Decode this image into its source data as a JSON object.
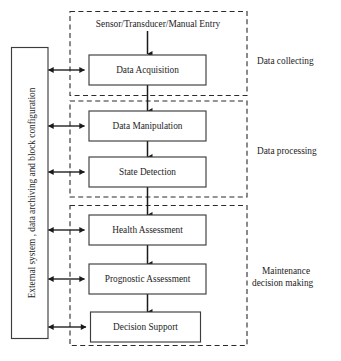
{
  "figure": {
    "type": "block-flow-diagram",
    "canvas": {
      "width": 341,
      "height": 361
    },
    "background_color": "#ffffff",
    "line_color": "#1a1a1a",
    "box_stroke_color": "#3d3d3d",
    "box_fill_color": "#ffffff",
    "dashed_group_color": "#2b2b2b"
  },
  "source": {
    "label": "Sensor/Transducer/Manual Entry"
  },
  "sidebar": {
    "label": "External system , data archiving and block configuration",
    "orientation": "vertical-bottom-to-top"
  },
  "nodes": [
    {
      "id": "data-acquisition",
      "label": "Data Acquisition",
      "group": "data-collecting"
    },
    {
      "id": "data-manipulation",
      "label": "Data Manipulation",
      "group": "data-processing"
    },
    {
      "id": "state-detection",
      "label": "State Detection",
      "group": "data-processing"
    },
    {
      "id": "health-assessment",
      "label": "Health Assessment",
      "group": "maintenance-decision-making"
    },
    {
      "id": "prognostic-assessment",
      "label": "Prognostic Assessment",
      "group": "maintenance-decision-making"
    },
    {
      "id": "decision-support",
      "label": "Decision Support",
      "group": "maintenance-decision-making"
    }
  ],
  "groups": [
    {
      "id": "data-collecting",
      "label": "Data collecting",
      "label_lines": [
        "Data collecting"
      ]
    },
    {
      "id": "data-processing",
      "label": "Data processing",
      "label_lines": [
        "Data processing"
      ]
    },
    {
      "id": "maintenance-decision-making",
      "label": "Maintenance decision making",
      "label_lines": [
        "Maintenance",
        "decision making"
      ]
    }
  ],
  "flows": [
    {
      "from": "source",
      "to": "data-acquisition",
      "type": "single-arrow-down"
    },
    {
      "from": "data-acquisition",
      "to": "data-manipulation",
      "type": "single-arrow-down"
    },
    {
      "from": "data-manipulation",
      "to": "state-detection",
      "type": "single-arrow-down"
    },
    {
      "from": "state-detection",
      "to": "health-assessment",
      "type": "single-arrow-down"
    },
    {
      "from": "health-assessment",
      "to": "prognostic-assessment",
      "type": "single-arrow-down"
    },
    {
      "from": "prognostic-assessment",
      "to": "decision-support",
      "type": "single-arrow-down"
    },
    {
      "from": "sidebar",
      "to": "data-acquisition",
      "type": "double-arrow-horizontal"
    },
    {
      "from": "sidebar",
      "to": "data-manipulation",
      "type": "double-arrow-horizontal"
    },
    {
      "from": "sidebar",
      "to": "state-detection",
      "type": "double-arrow-horizontal"
    },
    {
      "from": "sidebar",
      "to": "health-assessment",
      "type": "double-arrow-horizontal"
    },
    {
      "from": "sidebar",
      "to": "prognostic-assessment",
      "type": "double-arrow-horizontal"
    },
    {
      "from": "sidebar",
      "to": "decision-support",
      "type": "double-arrow-horizontal"
    }
  ]
}
